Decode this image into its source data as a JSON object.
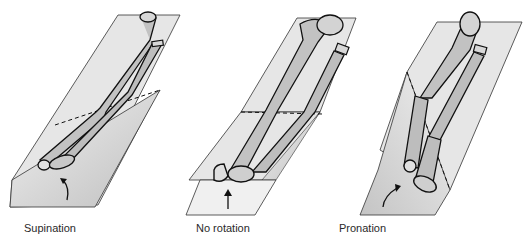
{
  "figure": {
    "panels": [
      {
        "id": "supination",
        "label": "Supination",
        "arrow": "curved-arrow-up-right"
      },
      {
        "id": "no-rotation",
        "label": "No rotation",
        "arrow": "straight-arrow-up"
      },
      {
        "id": "pronation",
        "label": "Pronation",
        "arrow": "curved-arrow-up-right"
      }
    ],
    "colors": {
      "plane_fill": "#e6e6e6",
      "plane_shadow": "#cfcfcf",
      "bone_fill": "#bdbdbd",
      "bone_end": "#d9d9d9",
      "outline": "#111111",
      "background": "#ffffff"
    }
  }
}
